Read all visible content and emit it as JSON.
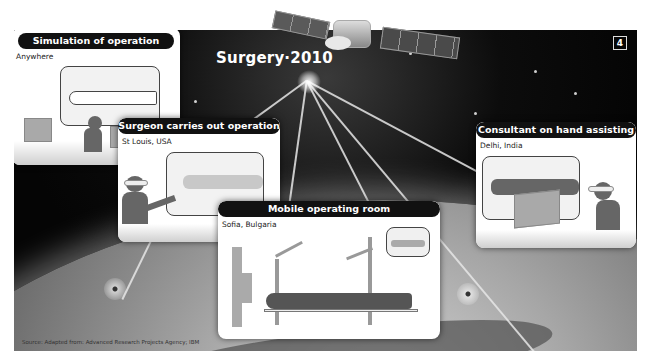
{
  "diagram": {
    "title": "Surgery·2010",
    "page_number": "4",
    "source": "Source: Adapted from: Advanced Research Projects Agency; IBM",
    "central_node": "satellite",
    "panels": [
      {
        "id": "simulation",
        "heading": "Simulation of operation",
        "location": "Anywhere",
        "scene": "Operator at computer workstations viewing a virtual patient outline"
      },
      {
        "id": "surgeon",
        "heading": "Surgeon carries out operation",
        "location": "St Louis, USA",
        "scene": "Surgeon with head-mounted display manipulating a virtual patient"
      },
      {
        "id": "mobile",
        "heading": "Mobile operating room",
        "location": "Sofia, Bulgaria",
        "scene": "Patient on table with two robotic arms; inset monitor"
      },
      {
        "id": "consultant",
        "heading": "Consultant on hand assisting",
        "location": "Delhi, India",
        "scene": "Consultant with head-mounted display at workstation"
      }
    ],
    "connections": [
      {
        "from": "satellite",
        "to": "surgeon"
      },
      {
        "from": "satellite",
        "to": "mobile"
      },
      {
        "from": "satellite",
        "to": "consultant"
      },
      {
        "from": "satellite",
        "to": "ground-station-right"
      },
      {
        "from": "satellite",
        "to": "earth-edge-right"
      },
      {
        "from": "surgeon",
        "to": "ground-station-left"
      }
    ],
    "colors": {
      "background": "#0a0a0a",
      "card": "#ffffff",
      "card_header": "#111111",
      "silhouette": "#666666",
      "beam": "#e6e6e6"
    }
  }
}
